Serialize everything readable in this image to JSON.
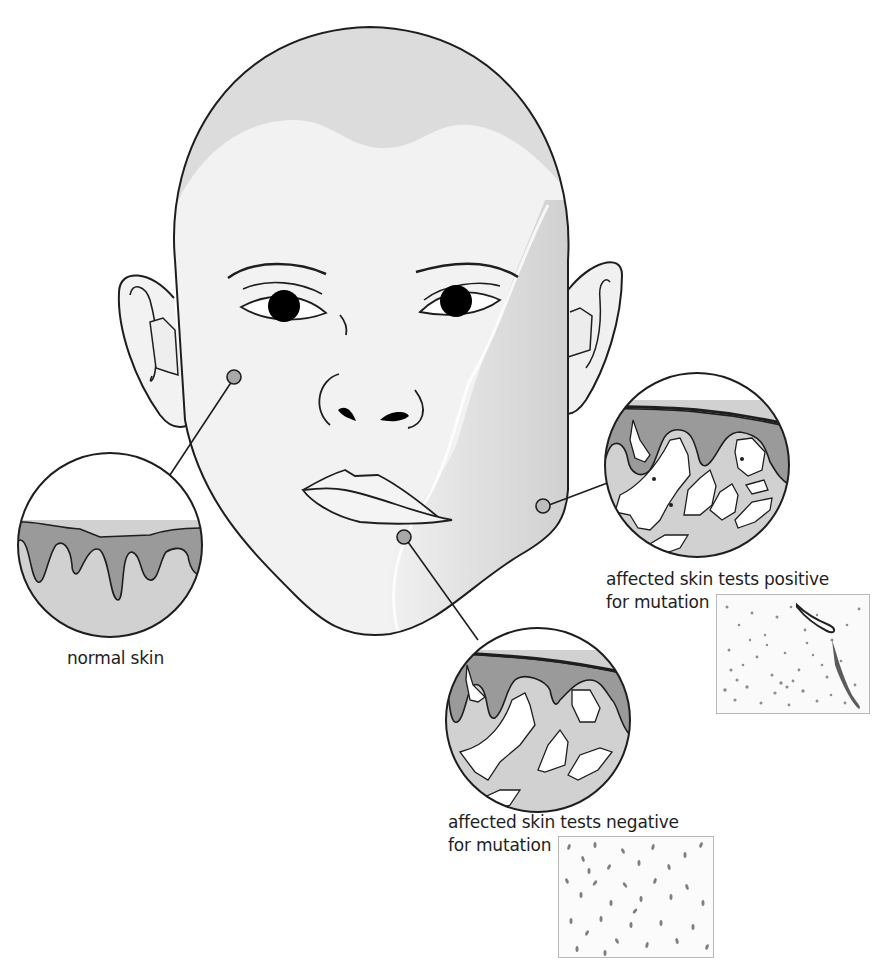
{
  "figure": {
    "type": "medical-illustration"
  },
  "colors": {
    "background": "#ffffff",
    "outline": "#1e1e1e",
    "face_skin": "#f4f4f4",
    "scalp": "#dedede",
    "affected_skin_shading": "#cfcfcf",
    "epidermis": "#9a9a9a",
    "dermis": "#d2d2d2",
    "lesion_white": "#ffffff",
    "pointer_dot": "#a8a8a8",
    "iris": "#000000"
  },
  "callouts": [
    {
      "id": "normal",
      "label": "normal skin",
      "anchor": "left cheek",
      "histology_image": false
    },
    {
      "id": "positive",
      "label_line1": "affected skin tests positive",
      "label_line2": "for mutation",
      "anchor": "right jaw",
      "histology_image": true
    },
    {
      "id": "negative",
      "label_line1": "affected skin tests negative",
      "label_line2": "for mutation",
      "anchor": "chin",
      "histology_image": true
    }
  ],
  "labels": {
    "normal": "normal skin",
    "positive_l1": "affected skin tests positive",
    "positive_l2": "for mutation",
    "negative_l1": "affected skin tests negative",
    "negative_l2": "for mutation"
  }
}
